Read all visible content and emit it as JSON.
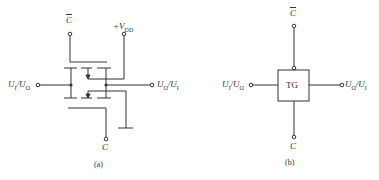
{
  "figure_a": {
    "caption": "(a)",
    "labels": {
      "c_bar": "C",
      "vdd_prefix": "+V",
      "vdd_sub": "DD",
      "left_main": "U",
      "left_sub1": "I",
      "left_mid": "/U",
      "left_sub2": "O",
      "right_main": "U",
      "right_sub1": "O",
      "right_mid": "/U",
      "right_sub2": "I",
      "c": "C"
    }
  },
  "figure_b": {
    "caption": "(b)",
    "block_label": "TG",
    "labels": {
      "c_bar": "C",
      "left_main": "U",
      "left_sub1": "I",
      "left_mid": "/U",
      "left_sub2": "O",
      "right_main": "U",
      "right_sub1": "O",
      "right_mid": "/U",
      "right_sub2": "I",
      "c": "C"
    }
  }
}
